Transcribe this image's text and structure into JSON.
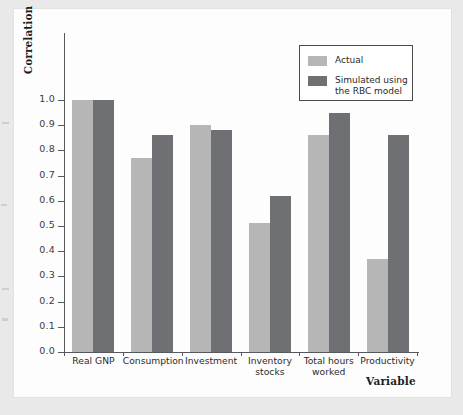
{
  "chart_data": {
    "type": "bar",
    "title": "",
    "xlabel": "Variable",
    "ylabel": "Correlation",
    "categories": [
      "Real GNP",
      "Consumption",
      "Investment",
      "Inventory\nstocks",
      "Total hours\nworked",
      "Productivity"
    ],
    "series": [
      {
        "name": "Actual",
        "color": "#b6b6b6",
        "values": [
          1.0,
          0.77,
          0.9,
          0.51,
          0.86,
          0.37
        ]
      },
      {
        "name": "Simulated using\nthe RBC model",
        "color": "#6e7073",
        "values": [
          1.0,
          0.86,
          0.88,
          0.62,
          0.95,
          0.86
        ]
      }
    ],
    "ylim": [
      0.0,
      1.0
    ],
    "yticks": [
      "0.0",
      "0.1",
      "0.2",
      "0.3",
      "0.4",
      "0.5",
      "0.6",
      "0.7",
      "0.8",
      "0.9",
      "1.0"
    ],
    "ytick_values": [
      0.0,
      0.1,
      0.2,
      0.3,
      0.4,
      0.5,
      0.6,
      0.7,
      0.8,
      0.9,
      1.0
    ],
    "grid": false,
    "legend_position": "top-right",
    "legend_entries": [
      "Actual",
      "Simulated using\nthe RBC model"
    ]
  },
  "axes": {
    "y_title": "Correlation",
    "x_title": "Variable"
  },
  "legend": {
    "actual_label": "Actual",
    "simulated_label": "Simulated using\nthe RBC model"
  },
  "colors": {
    "actual": "#b6b6b6",
    "simulated": "#6e7073",
    "axis": "#55585c",
    "paper": "#fdfdfd",
    "page": "#e9e9e9"
  }
}
